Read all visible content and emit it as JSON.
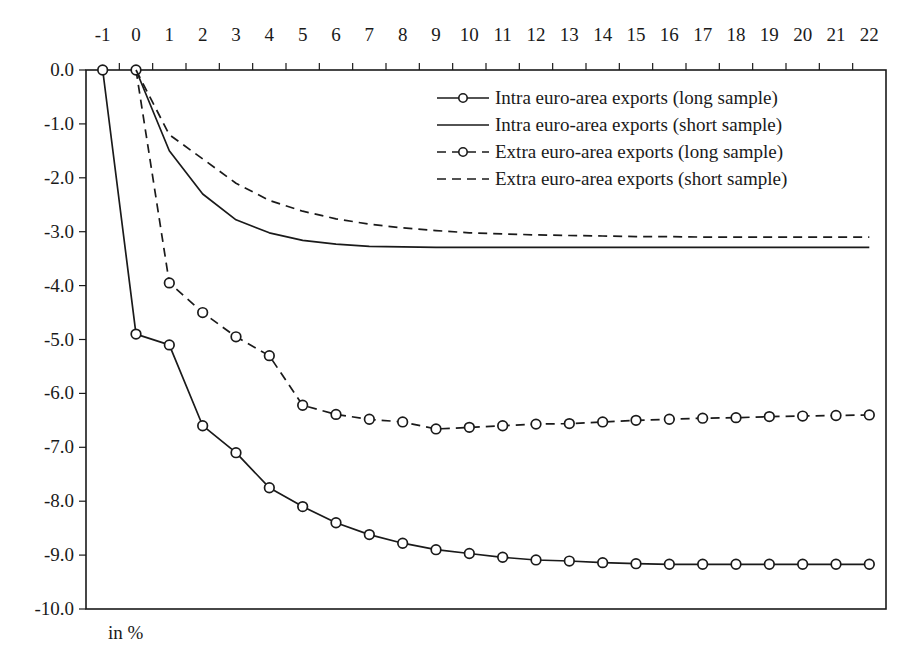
{
  "chart_data": {
    "type": "line",
    "title": "",
    "xlabel": "",
    "ylabel": "in %",
    "unit_note": "in %",
    "x": [
      -1,
      0,
      1,
      2,
      3,
      4,
      5,
      6,
      7,
      8,
      9,
      10,
      11,
      12,
      13,
      14,
      15,
      16,
      17,
      18,
      19,
      20,
      21,
      22
    ],
    "x_tick_labels": [
      "-1",
      "0",
      "1",
      "2",
      "3",
      "4",
      "5",
      "6",
      "7",
      "8",
      "9",
      "10",
      "11",
      "12",
      "13",
      "14",
      "15",
      "16",
      "17",
      "18",
      "19",
      "20",
      "21",
      "22"
    ],
    "x_axis_position": "top",
    "y_tick_labels": [
      "0.0",
      "-1.0",
      "-2.0",
      "-3.0",
      "-4.0",
      "-5.0",
      "-6.0",
      "-7.0",
      "-8.0",
      "-9.0",
      "-10.0"
    ],
    "y_ticks": [
      0,
      -1,
      -2,
      -3,
      -4,
      -5,
      -6,
      -7,
      -8,
      -9,
      -10
    ],
    "ylim": [
      -10,
      0
    ],
    "grid": false,
    "legend_position": "upper right, inside plot",
    "series": [
      {
        "name": "Intra euro-area exports (long sample)",
        "style": "solid",
        "markers": true,
        "x": [
          -1,
          0,
          1,
          2,
          3,
          4,
          5,
          6,
          7,
          8,
          9,
          10,
          11,
          12,
          13,
          14,
          15,
          16,
          17,
          18,
          19,
          20,
          21,
          22
        ],
        "values": [
          0.0,
          -4.9,
          -5.1,
          -6.6,
          -7.1,
          -7.75,
          -8.1,
          -8.4,
          -8.62,
          -8.78,
          -8.9,
          -8.97,
          -9.04,
          -9.09,
          -9.11,
          -9.14,
          -9.16,
          -9.17,
          -9.17,
          -9.17,
          -9.17,
          -9.17,
          -9.17,
          -9.17
        ]
      },
      {
        "name": "Intra euro-area exports (short sample)",
        "style": "solid",
        "markers": false,
        "x": [
          0,
          1,
          2,
          3,
          4,
          5,
          6,
          7,
          8,
          9,
          10,
          11,
          12,
          13,
          14,
          15,
          16,
          17,
          18,
          19,
          20,
          21,
          22
        ],
        "values": [
          0.0,
          -1.5,
          -2.3,
          -2.78,
          -3.02,
          -3.16,
          -3.23,
          -3.27,
          -3.28,
          -3.29,
          -3.29,
          -3.29,
          -3.29,
          -3.29,
          -3.29,
          -3.29,
          -3.29,
          -3.29,
          -3.29,
          -3.29,
          -3.29,
          -3.29,
          -3.29
        ]
      },
      {
        "name": "Extra euro-area exports (long sample)",
        "style": "dashed",
        "markers": true,
        "x": [
          0,
          1,
          2,
          3,
          4,
          5,
          6,
          7,
          8,
          9,
          10,
          11,
          12,
          13,
          14,
          15,
          16,
          17,
          18,
          19,
          20,
          21,
          22
        ],
        "values": [
          0.0,
          -3.95,
          -4.5,
          -4.95,
          -5.3,
          -6.22,
          -6.39,
          -6.48,
          -6.53,
          -6.66,
          -6.63,
          -6.6,
          -6.57,
          -6.56,
          -6.53,
          -6.5,
          -6.48,
          -6.46,
          -6.45,
          -6.43,
          -6.42,
          -6.41,
          -6.4
        ]
      },
      {
        "name": "Extra euro-area exports (short sample)",
        "style": "dashed",
        "markers": false,
        "x": [
          0,
          1,
          2,
          3,
          4,
          5,
          6,
          7,
          8,
          9,
          10,
          11,
          12,
          13,
          14,
          15,
          16,
          17,
          18,
          19,
          20,
          21,
          22
        ],
        "values": [
          0.0,
          -1.2,
          -1.65,
          -2.1,
          -2.42,
          -2.62,
          -2.76,
          -2.86,
          -2.93,
          -2.98,
          -3.02,
          -3.04,
          -3.06,
          -3.07,
          -3.08,
          -3.09,
          -3.09,
          -3.1,
          -3.1,
          -3.1,
          -3.1,
          -3.1,
          -3.1
        ]
      }
    ]
  },
  "colors": {
    "line": "#1a1a1a",
    "marker_fill": "#ffffff",
    "background": "#ffffff"
  }
}
